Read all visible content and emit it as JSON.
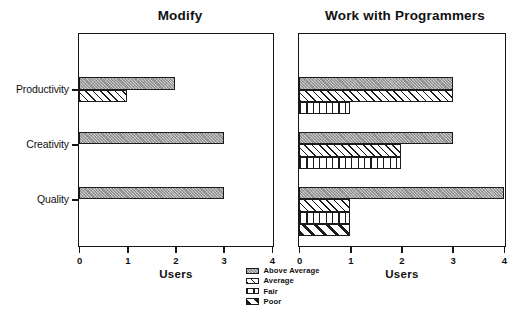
{
  "chart_data": [
    {
      "type": "bar",
      "orientation": "horizontal",
      "title": "Modify",
      "xlabel": "Users",
      "ylabel": "",
      "xlim": [
        0,
        4
      ],
      "xticks": [
        "0",
        "1",
        "2",
        "3",
        "4"
      ],
      "grid": false,
      "categories": [
        "Productivity",
        "Creativity",
        "Quality"
      ],
      "series": [
        {
          "name": "Above Average",
          "values": [
            2,
            3,
            3
          ]
        },
        {
          "name": "Average",
          "values": [
            1,
            0,
            0
          ]
        },
        {
          "name": "Fair",
          "values": [
            0,
            0,
            0
          ]
        },
        {
          "name": "Poor",
          "values": [
            0,
            0,
            0
          ]
        }
      ]
    },
    {
      "type": "bar",
      "orientation": "horizontal",
      "title": "Work with Programmers",
      "xlabel": "Users",
      "ylabel": "",
      "xlim": [
        0,
        4
      ],
      "xticks": [
        "0",
        "1",
        "2",
        "3",
        "4"
      ],
      "grid": false,
      "categories": [
        "Productivity",
        "Creativity",
        "Quality"
      ],
      "series": [
        {
          "name": "Above Average",
          "values": [
            3,
            3,
            4
          ]
        },
        {
          "name": "Average",
          "values": [
            3,
            2,
            1
          ]
        },
        {
          "name": "Fair",
          "values": [
            1,
            2,
            1
          ]
        },
        {
          "name": "Poor",
          "values": [
            0,
            0,
            1
          ]
        }
      ]
    }
  ],
  "legend": {
    "position": "bottom-center",
    "entries": [
      {
        "label": "Above Average",
        "pattern": "stipple-gray",
        "color": "#9e9e9e"
      },
      {
        "label": "Average",
        "pattern": "diagonal-thin",
        "color": "#1b1b1b"
      },
      {
        "label": "Fair",
        "pattern": "vertical-lines",
        "color": "#1b1b1b"
      },
      {
        "label": "Poor",
        "pattern": "diagonal-thick",
        "color": "#1b1b1b"
      }
    ]
  },
  "style": {
    "background": "#ffffff",
    "axis_color": "#161616",
    "text_color": "#111111"
  }
}
